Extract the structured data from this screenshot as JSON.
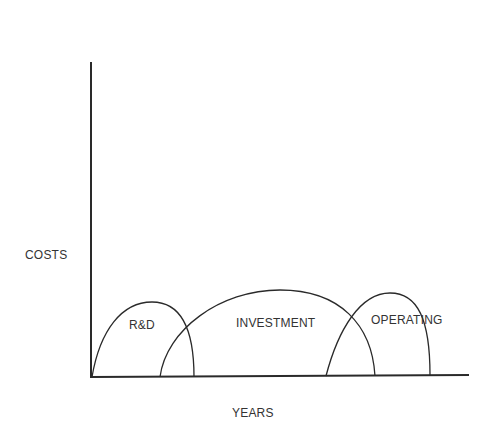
{
  "diagram": {
    "type": "cost-phase-diagram",
    "y_axis_label": "COSTS",
    "x_axis_label": "YEARS",
    "phases": [
      {
        "label": "R&D",
        "order": 1
      },
      {
        "label": "INVESTMENT",
        "order": 2
      },
      {
        "label": "OPERATING",
        "order": 3
      }
    ],
    "colors": {
      "line": "#2a2a2a",
      "background": "#ffffff"
    }
  }
}
